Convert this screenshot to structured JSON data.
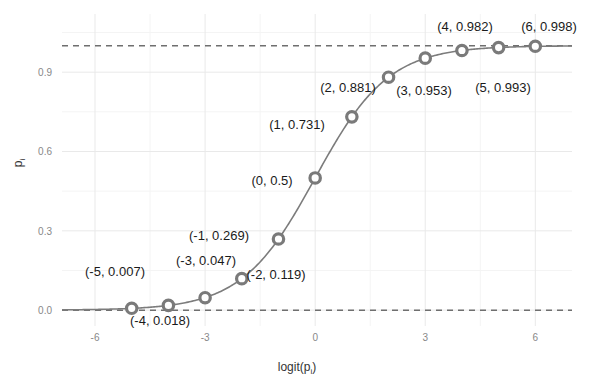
{
  "chart_data": {
    "type": "line",
    "title": "",
    "subtitle": "",
    "xlabel": "logit(pᵢ)",
    "xlabel_base": "logit(p",
    "xlabel_sub": "i",
    "xlabel_close": ")",
    "ylabel": "pᵢ",
    "ylabel_base": "p",
    "ylabel_sub": "i",
    "xlim": [
      -6.9,
      7.0
    ],
    "ylim": [
      -0.06,
      1.12
    ],
    "xticks": [
      -6,
      -3,
      0,
      3,
      6
    ],
    "xtick_labels": [
      "-6",
      "-3",
      "0",
      "3",
      "6"
    ],
    "yticks": [
      0.0,
      0.3,
      0.6,
      0.9
    ],
    "ytick_labels": [
      "0.0",
      "0.3",
      "0.6",
      "0.9"
    ],
    "x_minor_ticks": [
      -4.5,
      -1.5,
      1.5,
      4.5
    ],
    "y_minor_ticks": [
      0.15,
      0.45,
      0.75,
      1.05
    ],
    "grid": true,
    "legend": "none",
    "series": [
      {
        "name": "logistic",
        "x": [
          -5,
          -4,
          -3,
          -2,
          -1,
          0,
          1,
          2,
          3,
          4,
          5,
          6
        ],
        "values": [
          0.007,
          0.018,
          0.047,
          0.119,
          0.269,
          0.5,
          0.731,
          0.881,
          0.953,
          0.982,
          0.993,
          0.998
        ]
      }
    ],
    "reference_lines": [
      {
        "name": "upper-asymptote",
        "y": 1.0,
        "style": "dashed"
      },
      {
        "name": "lower-asymptote",
        "y": 0.0,
        "style": "dashed"
      }
    ],
    "annotations": [
      {
        "text": "(-5, 0.007)",
        "x": -5,
        "y": 0.007,
        "lx": 115,
        "ly": 276,
        "anchor": "middle"
      },
      {
        "text": "(-4, 0.018)",
        "x": -4,
        "y": 0.018,
        "lx": 160,
        "ly": 325,
        "anchor": "middle"
      },
      {
        "text": "(-3, 0.047)",
        "x": -3,
        "y": 0.047,
        "lx": 206,
        "ly": 265,
        "anchor": "middle"
      },
      {
        "text": "(-2, 0.119)",
        "x": -2,
        "y": 0.119,
        "lx": 276,
        "ly": 279,
        "anchor": "middle"
      },
      {
        "text": "(-1, 0.269)",
        "x": -1,
        "y": 0.269,
        "lx": 219,
        "ly": 240,
        "anchor": "middle"
      },
      {
        "text": "(0, 0.5)",
        "x": 0,
        "y": 0.5,
        "lx": 272,
        "ly": 185,
        "anchor": "middle"
      },
      {
        "text": "(1, 0.731)",
        "x": 1,
        "y": 0.731,
        "lx": 297,
        "ly": 129,
        "anchor": "middle"
      },
      {
        "text": "(2, 0.881)",
        "x": 2,
        "y": 0.881,
        "lx": 348,
        "ly": 92,
        "anchor": "middle"
      },
      {
        "text": "(3, 0.953)",
        "x": 3,
        "y": 0.953,
        "lx": 424,
        "ly": 95,
        "anchor": "middle"
      },
      {
        "text": "(4, 0.982)",
        "x": 4,
        "y": 0.982,
        "lx": 465,
        "ly": 31,
        "anchor": "middle"
      },
      {
        "text": "(5, 0.993)",
        "x": 5,
        "y": 0.993,
        "lx": 503,
        "ly": 92,
        "anchor": "middle"
      },
      {
        "text": "(6, 0.998)",
        "x": 6,
        "y": 0.998,
        "lx": 549,
        "ly": 31,
        "anchor": "middle"
      }
    ]
  },
  "colors": {
    "curve": "#7c7c7c",
    "marker_stroke": "#7a7a7a",
    "marker_fill": "#ffffff",
    "asymptote": "#6f6f6f",
    "grid_major": "#e9e9e9",
    "grid_minor": "#f4f4f4",
    "tick_text": "#888888",
    "label_text": "#1a1a1a",
    "background": "#ffffff"
  }
}
